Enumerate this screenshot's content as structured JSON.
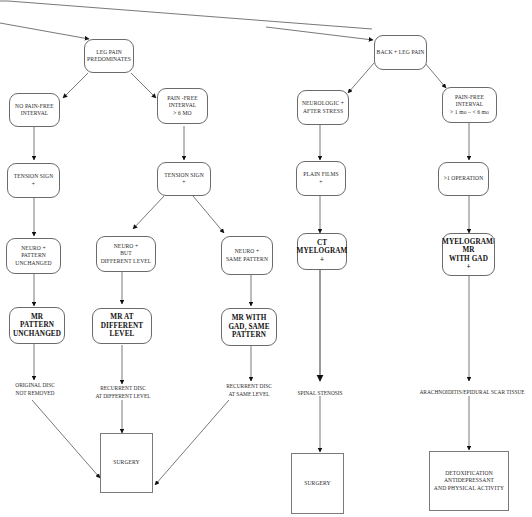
{
  "diagram": {
    "type": "clinical-flowchart",
    "branches": [
      {
        "root": "LEG PAIN PREDOMINATES",
        "subbranches": [
          {
            "condition": "NO PAIN-FREE INTERVAL",
            "path": [
              "TENSION SIGN +",
              "NEURO + PATTERN UNCHANGED",
              "MR PATTERN UNCHANGED",
              "ORIGINAL DISC NOT REMOVED",
              "SURGERY"
            ]
          },
          {
            "condition": "PAIN-FREE INTERVAL > 6 MO",
            "path": [
              "TENSION SIGN +"
            ],
            "splits": [
              {
                "path": [
                  "NEURO + BUT DIFFERENT LEVEL",
                  "MR AT DIFFERENT LEVEL",
                  "RECURRENT DISC AT DIFFERENT LEVEL",
                  "SURGERY"
                ]
              },
              {
                "path": [
                  "NEURO + SAME PATTERN",
                  "MR WITH GAD, SAME PATTERN",
                  "RECURRENT DISC AT SAME LEVEL",
                  "SURGERY"
                ]
              }
            ]
          }
        ]
      },
      {
        "root": "BACK + LEG PAIN",
        "subbranches": [
          {
            "condition": "NEUROLOGIC + AFTER STRESS",
            "path": [
              "PLAIN FILMS +",
              "CT MYELOGRAM +",
              "SPINAL STENOSIS",
              "SURGERY"
            ]
          },
          {
            "condition": "PAIN-FREE INTERVAL > 1 mo - < 6 mo",
            "path": [
              ">1 OPERATION",
              "MYELOGRAM/ MR WITH GAD +",
              "ARACHNOIDITIS/EPIDURAL SCAR TISSUE",
              "DETOXIFICATION ANTIDEPRESSANT AND PHYSICAL ACTIVITY"
            ]
          }
        ]
      }
    ]
  },
  "nodes": {
    "leg_pain": {
      "lines": [
        "LEG PAIN",
        "PREDOMINATES"
      ]
    },
    "no_pain_free": {
      "lines": [
        "NO PAIN-FREE",
        "INTERVAL"
      ]
    },
    "pain_free_6mo": {
      "lines": [
        "PAIN -FREE",
        "INTERVAL",
        "> 6 MO"
      ]
    },
    "tension_left": {
      "lines": [
        "TENSION SIGN",
        "+"
      ]
    },
    "tension_mid": {
      "lines": [
        "TENSION SIGN",
        "+"
      ]
    },
    "neuro_unchanged": {
      "lines": [
        "NEURO +",
        "PATTERN",
        "UNCHANGED"
      ]
    },
    "neuro_diff": {
      "lines": [
        "NEURO +",
        "BUT",
        "DIFFERENT LEVEL"
      ]
    },
    "neuro_same": {
      "lines": [
        "NEURO +",
        "SAME PATTERN"
      ]
    },
    "mr_unchanged": {
      "lines": [
        "MR",
        "PATTERN",
        "UNCHANGED"
      ]
    },
    "mr_diff": {
      "lines": [
        "MR  AT",
        "DIFFERENT",
        "LEVEL"
      ]
    },
    "mr_gad_same": {
      "lines": [
        "MR  WITH",
        "GAD, SAME",
        "PATTERN"
      ]
    },
    "original_disc": {
      "lines": [
        "ORIGINAL DISC",
        "NOT REMOVED"
      ]
    },
    "recurrent_diff": {
      "lines": [
        "RECURRENT DISC",
        "AT DIFFERENT LEVEL"
      ]
    },
    "recurrent_same": {
      "lines": [
        "RECURRENT DISC",
        "AT SAME LEVEL"
      ]
    },
    "surgery_left": {
      "lines": [
        "SURGERY"
      ]
    },
    "back_leg": {
      "lines": [
        "BACK  + LEG PAIN"
      ]
    },
    "neurologic_stress": {
      "lines": [
        "NEUROLOGIC +",
        "AFTER STRESS"
      ]
    },
    "pain_free_1_6": {
      "lines": [
        "PAIN-FREE",
        "INTERVAL",
        "> 1 mo – < 6 mo"
      ]
    },
    "plain_films": {
      "lines": [
        "PLAIN FILMS",
        "+"
      ]
    },
    "gt1_operation": {
      "lines": [
        ">1  OPERATION"
      ]
    },
    "ct_myelogram": {
      "lines": [
        "CT",
        "MYELOGRAM",
        "+"
      ]
    },
    "myelogram_mr": {
      "lines": [
        "MYELOGRAM/",
        "MR",
        "WITH GAD",
        "+"
      ]
    },
    "spinal_stenosis": {
      "lines": [
        "SPINAL STENOSIS"
      ]
    },
    "arachnoiditis": {
      "lines": [
        "ARACHNOIDITIS/EPIDURAL SCAR TISSUE"
      ]
    },
    "surgery_right": {
      "lines": [
        "SURGERY"
      ]
    },
    "detox": {
      "lines": [
        "DETOXIFICATION",
        "ANTIDEPRESSANT",
        "AND PHYSICAL ACTIVITY"
      ]
    }
  },
  "colors": {
    "line": "#555555",
    "border": "#6b6b6b",
    "text": "#2a2a2a",
    "background": "#ffffff"
  }
}
